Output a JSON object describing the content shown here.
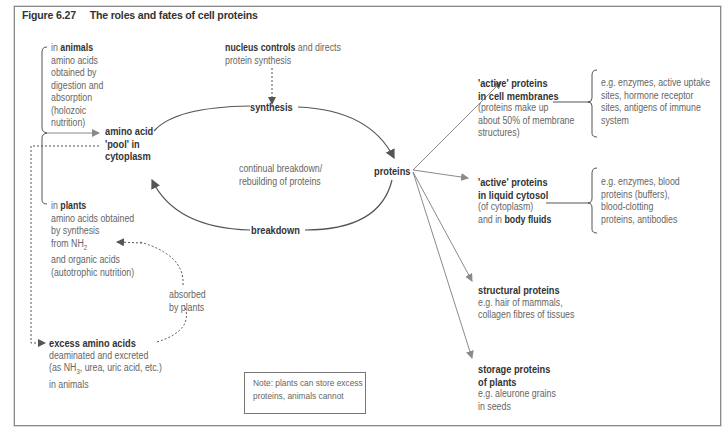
{
  "figure": {
    "number": "Figure 6.27",
    "title": "The roles and fates of cell proteins"
  },
  "left": {
    "animals": {
      "prefix": "in ",
      "label": "animals",
      "lines": [
        "amino acids",
        "obtained by",
        "digestion and",
        "absorption",
        "(holozoic",
        "nutrition)"
      ]
    },
    "pool": {
      "lines": [
        "amino acid",
        "'pool' in",
        "cytoplasm"
      ]
    },
    "plants": {
      "prefix": "in ",
      "label": "plants",
      "lines": [
        "amino acids obtained",
        "by synthesis",
        "from NH",
        "and organic acids",
        "(autotrophic nutrition)"
      ],
      "subscript": "2"
    },
    "absorbed": {
      "lines": [
        "absorbed",
        "by plants"
      ]
    },
    "excess": {
      "label": "excess amino acids",
      "lines": [
        "deaminated and excreted",
        "(as NH",
        ", urea, uric acid, etc.)",
        "in animals"
      ],
      "subscript": "3"
    }
  },
  "cycle": {
    "nucleus": {
      "label": "nucleus controls",
      "rest": " and directs",
      "line2": "protein synthesis"
    },
    "synthesis": "synthesis",
    "breakdown": "breakdown",
    "center": [
      "continual breakdown/",
      "rebuilding of proteins"
    ],
    "proteins": "proteins"
  },
  "fates": [
    {
      "title": [
        "'active' proteins",
        "in cell membranes"
      ],
      "lines": [
        "(proteins make up",
        "about 50% of membrane",
        "structures)"
      ],
      "examples": [
        "e.g. enzymes, active uptake",
        "sites, hormone receptor",
        "sites, antigens of immune",
        "system"
      ]
    },
    {
      "title": [
        "'active' proteins",
        "in liquid cytosol"
      ],
      "lines": [
        "(of cytoplasm)"
      ],
      "extra": {
        "prefix": "and in ",
        "label": "body fluids"
      },
      "examples": [
        "e.g. enzymes, blood",
        "proteins (buffers),",
        "blood-clotting",
        "proteins, antibodies"
      ]
    },
    {
      "title": [
        "structural proteins"
      ],
      "lines": [
        "e.g. hair of mammals,",
        "collagen fibres of tissues"
      ]
    },
    {
      "title": [
        "storage proteins",
        "of plants"
      ],
      "lines": [
        "e.g. aleurone grains",
        "in seeds"
      ]
    }
  ],
  "note": [
    "Note: plants can store excess",
    "proteins, animals cannot"
  ],
  "colors": {
    "line": "#555555",
    "arrow_grey": "#8a8a8a",
    "text": "#666666",
    "bold": "#333333"
  }
}
